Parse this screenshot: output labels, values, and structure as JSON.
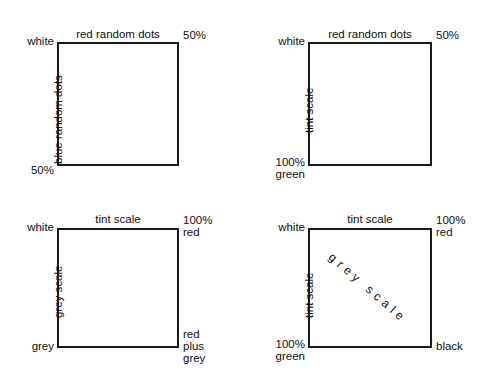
{
  "figure": {
    "type": "diagram",
    "panel_count": 4
  },
  "panels": [
    {
      "id": "panel-top-left",
      "top_title": "red random dots",
      "left_axis_label": "blue random dots",
      "corner_top_left": "white",
      "corner_top_right": "50%",
      "corner_bottom_left": "50%",
      "corner_bottom_right": "",
      "diagonal_label": ""
    },
    {
      "id": "panel-top-right",
      "top_title": "red random dots",
      "left_axis_label": "tint scale",
      "corner_top_left": "white",
      "corner_top_right": "50%",
      "corner_bottom_left_line1": "100%",
      "corner_bottom_left_line2": "green",
      "corner_bottom_right": "",
      "diagonal_label": ""
    },
    {
      "id": "panel-bottom-left",
      "top_title": "tint scale",
      "left_axis_label": "grey scale",
      "corner_top_left": "white",
      "corner_top_right_line1": "100%",
      "corner_top_right_line2": "red",
      "corner_bottom_left": "grey",
      "corner_bottom_right_line1": "red",
      "corner_bottom_right_line2": "plus",
      "corner_bottom_right_line3": "grey",
      "diagonal_label": ""
    },
    {
      "id": "panel-bottom-right",
      "top_title": "tint scale",
      "left_axis_label": "tint scale",
      "corner_top_left": "white",
      "corner_top_right_line1": "100%",
      "corner_top_right_line2": "red",
      "corner_bottom_left_line1": "100%",
      "corner_bottom_left_line2": "green",
      "corner_bottom_right": "black",
      "diagonal_label": "grey scale"
    }
  ],
  "colors": {
    "stroke": "#1a1a1a",
    "text": "#111111",
    "background": "#ffffff"
  }
}
